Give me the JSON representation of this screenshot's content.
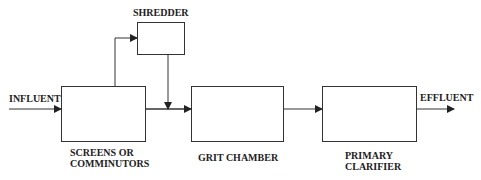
{
  "diagram": {
    "type": "process-flow",
    "stroke_color": "#333333",
    "labels": {
      "influent": "INFLUENT",
      "effluent": "EFFLUENT",
      "shredder": "SHREDDER",
      "screens_line1": "SCREENS OR",
      "screens_line2": "COMMINUTORS",
      "grit": "GRIT CHAMBER",
      "clarifier_line1": "PRIMARY",
      "clarifier_line2": "CLARIFIER"
    },
    "nodes": [
      {
        "id": "screens",
        "label": "SCREENS OR COMMINUTORS"
      },
      {
        "id": "shredder",
        "label": "SHREDDER"
      },
      {
        "id": "grit",
        "label": "GRIT CHAMBER"
      },
      {
        "id": "clarifier",
        "label": "PRIMARY CLARIFIER"
      }
    ],
    "edges": [
      {
        "from": "INFLUENT",
        "to": "screens"
      },
      {
        "from": "screens",
        "to": "shredder"
      },
      {
        "from": "shredder",
        "to": "grit"
      },
      {
        "from": "screens",
        "to": "grit"
      },
      {
        "from": "grit",
        "to": "clarifier"
      },
      {
        "from": "clarifier",
        "to": "EFFLUENT"
      }
    ]
  }
}
